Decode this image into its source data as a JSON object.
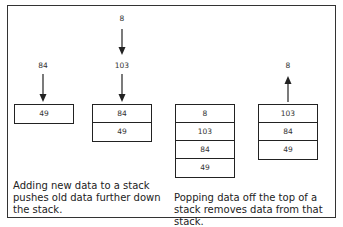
{
  "diagram": {
    "push": {
      "incoming_first": "84",
      "incoming_second": "8",
      "incoming_second_pushes": "103",
      "stack_before": [
        "49"
      ],
      "stack_after": [
        "84",
        "49"
      ],
      "caption": "Adding new data to a stack pushes old data further down the stack."
    },
    "pop": {
      "stack_before": [
        "8",
        "103",
        "84",
        "49"
      ],
      "stack_after": [
        "103",
        "84",
        "49"
      ],
      "popped": "8",
      "caption": "Popping data off the top of a stack removes data from that stack."
    },
    "colors": {
      "line": "#222222",
      "background": "#ffffff"
    }
  }
}
